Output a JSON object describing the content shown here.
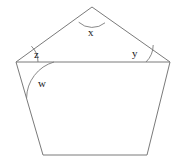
{
  "figure": {
    "type": "geometry-diagram",
    "stroke_color": "#7a7a7a",
    "label_color": "#1a1a1a",
    "background_color": "#ffffff",
    "canvas": {
      "width": 182,
      "height": 166
    },
    "vertices": [
      {
        "name": "apex",
        "x": 92,
        "y": 7
      },
      {
        "name": "right-upper",
        "x": 170,
        "y": 62
      },
      {
        "name": "bottom-right",
        "x": 147,
        "y": 155
      },
      {
        "name": "bottom-left",
        "x": 43,
        "y": 155
      },
      {
        "name": "left-upper",
        "x": 16,
        "y": 62
      }
    ],
    "chord": {
      "from": "left-upper",
      "to": "right-upper",
      "x1": 16,
      "y1": 62,
      "x2": 170,
      "y2": 62
    },
    "angle_labels": [
      {
        "id": "x",
        "text": "x",
        "x": 88,
        "y": 27,
        "at_vertex": "apex"
      },
      {
        "id": "y",
        "text": "y",
        "x": 132,
        "y": 48,
        "at_vertex": "right-upper"
      },
      {
        "id": "z",
        "text": "z",
        "x": 34,
        "y": 49,
        "at_vertex": "left-upper"
      },
      {
        "id": "w",
        "text": "w",
        "x": 38,
        "y": 78,
        "at_vertex": "left-upper"
      }
    ],
    "arcs": [
      {
        "id": "arc-x",
        "vertex": "apex",
        "radius": 20,
        "path": "M 78.7 22.2 A 20 20 0 0 0 105.0 22.8"
      },
      {
        "id": "arc-y",
        "vertex": "right-upper",
        "radius": 24,
        "path": "M 146.0 62.0 A 24 24 0 0 0 153.2 45.0"
      },
      {
        "id": "arc-z",
        "vertex": "left-upper",
        "radius": 22,
        "path": "M 38.0 62.0 A 22 22 0 0 0 31.4 46.2"
      },
      {
        "id": "arc-w",
        "vertex": "left-upper",
        "radius": 38,
        "path": "M 54.0 62.0 A 38 38 0 0 0 26.6 98.0"
      }
    ]
  }
}
